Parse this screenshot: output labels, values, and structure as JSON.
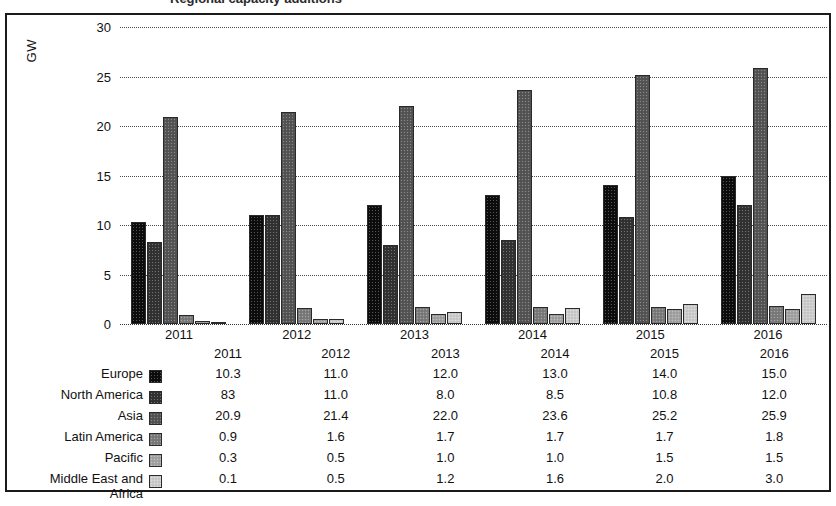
{
  "title_partial": "Regional capacity additions",
  "axis": {
    "y_label": "GW",
    "y_ticks": [
      "30",
      "25",
      "20",
      "15",
      "10",
      "5",
      "0"
    ],
    "x_ticks": [
      "2011",
      "2012",
      "2013",
      "2014",
      "2015",
      "2016"
    ]
  },
  "table": {
    "header_blank": "",
    "years": [
      "2011",
      "2012",
      "2013",
      "2014",
      "2015",
      "2016"
    ],
    "rows": [
      {
        "label": "Europe",
        "label2": "",
        "color": "#0d0d0d",
        "values": [
          "10.3",
          "11.0",
          "12.0",
          "13.0",
          "14.0",
          "15.0"
        ]
      },
      {
        "label": "North America",
        "label2": "",
        "color": "#333333",
        "values": [
          "83",
          "11.0",
          "8.0",
          "8.5",
          "10.8",
          "12.0"
        ]
      },
      {
        "label": "Asia",
        "label2": "",
        "color": "#565656",
        "values": [
          "20.9",
          "21.4",
          "22.0",
          "23.6",
          "25.2",
          "25.9"
        ]
      },
      {
        "label": "Latin America",
        "label2": "",
        "color": "#7d7d7d",
        "values": [
          "0.9",
          "1.6",
          "1.7",
          "1.7",
          "1.7",
          "1.8"
        ]
      },
      {
        "label": "Pacific",
        "label2": "",
        "color": "#a5a5a5",
        "values": [
          "0.3",
          "0.5",
          "1.0",
          "1.0",
          "1.5",
          "1.5"
        ]
      },
      {
        "label": "Middle East and",
        "label2": "Africa",
        "color": "#cfcfcf",
        "values": [
          "0.1",
          "0.5",
          "1.2",
          "1.6",
          "2.0",
          "3.0"
        ]
      }
    ]
  },
  "chart_data": {
    "type": "bar",
    "title": "Regional capacity additions",
    "xlabel": "",
    "ylabel": "GW",
    "ylim": [
      0,
      30
    ],
    "ytick_step": 5,
    "grid": true,
    "legend": "table-below",
    "categories": [
      "2011",
      "2012",
      "2013",
      "2014",
      "2015",
      "2016"
    ],
    "series": [
      {
        "name": "Europe",
        "color": "#0d0d0d",
        "values": [
          10.3,
          11.0,
          12.0,
          13.0,
          14.0,
          15.0
        ]
      },
      {
        "name": "North America",
        "color": "#333333",
        "values": [
          8.3,
          11.0,
          8.0,
          8.5,
          10.8,
          12.0
        ]
      },
      {
        "name": "Asia",
        "color": "#565656",
        "values": [
          20.9,
          21.4,
          22.0,
          23.6,
          25.2,
          25.9
        ]
      },
      {
        "name": "Latin America",
        "color": "#7d7d7d",
        "values": [
          0.9,
          1.6,
          1.7,
          1.7,
          1.7,
          1.8
        ]
      },
      {
        "name": "Pacific",
        "color": "#a5a5a5",
        "values": [
          0.3,
          0.5,
          1.0,
          1.0,
          1.5,
          1.5
        ]
      },
      {
        "name": "Middle East and Africa",
        "color": "#cfcfcf",
        "values": [
          0.1,
          0.5,
          1.2,
          1.6,
          2.0,
          3.0
        ]
      }
    ]
  }
}
